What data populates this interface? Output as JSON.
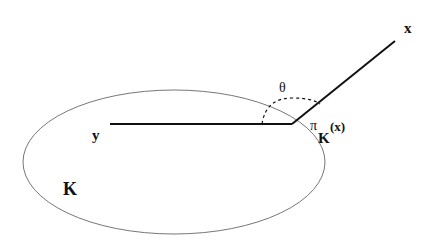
{
  "diagram": {
    "set_label": "K",
    "point_inside_label": "y",
    "point_outside_label": "x",
    "angle_label": "θ",
    "projection_label": {
      "symbol": "π",
      "subscript": "K",
      "argument": "(x)"
    },
    "colors": {
      "ink": "#111111",
      "ellipse_stroke": "#777777",
      "background": "#ffffff"
    }
  }
}
